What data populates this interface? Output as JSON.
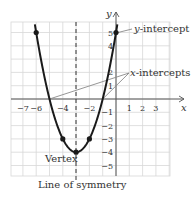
{
  "chart_data": {
    "type": "line",
    "title": "",
    "xlabel": "x",
    "ylabel": "y",
    "function": "y = x^2 + 6x + 5",
    "xlim": [
      -8,
      4
    ],
    "ylim": [
      -5.8,
      5.8
    ],
    "grid": true,
    "x_ticks": [
      "-7",
      "-6",
      "-4",
      "-2",
      "1",
      "2",
      "3"
    ],
    "y_ticks": [
      "5",
      "4",
      "2",
      "1",
      "-1",
      "-2",
      "-3",
      "-4",
      "-5"
    ],
    "points": [
      {
        "x": -6,
        "y": 5
      },
      {
        "x": -4,
        "y": -3
      },
      {
        "x": -3,
        "y": -4
      },
      {
        "x": -2,
        "y": -3
      },
      {
        "x": 0,
        "y": 5
      }
    ],
    "vertex": {
      "x": -3,
      "y": -4
    },
    "x_intercepts": [
      -5,
      -1
    ],
    "y_intercept": 5,
    "axis_of_symmetry": -3,
    "annotations": {
      "y_intercept_label": "-intercept",
      "y_intercept_var": "y",
      "x_intercepts_label": "-intercepts",
      "x_intercepts_var": "x",
      "vertex_label": "Vertex",
      "symmetry_label": "Line of symmetry"
    },
    "colors": {
      "curve": "#1a1a1a",
      "grid": "#d8d8d8",
      "axis": "#555555",
      "pointer": "#8a8a8a"
    }
  }
}
